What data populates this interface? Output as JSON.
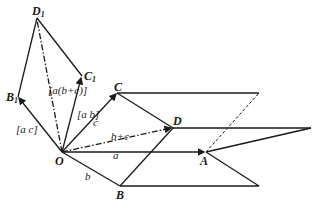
{
  "diagram": {
    "points": {
      "O": {
        "label": "O",
        "x": 62,
        "y": 152
      },
      "A": {
        "label": "A",
        "x": 206,
        "y": 152
      },
      "B": {
        "label": "B",
        "x": 120,
        "y": 186
      },
      "C": {
        "label": "C",
        "x": 117,
        "y": 93
      },
      "D": {
        "label": "D",
        "x": 173,
        "y": 128
      },
      "B1": {
        "label": "B",
        "sub": "1",
        "x": 18,
        "y": 97
      },
      "C1": {
        "label": "C",
        "sub": "1",
        "x": 82,
        "y": 76
      },
      "D1": {
        "label": "D",
        "sub": "1",
        "x": 37,
        "y": 18
      }
    },
    "vector_labels": {
      "a": "a",
      "b": "b",
      "c": "c",
      "b_plus_c": "b+c",
      "ab": "[a b]",
      "ac": "[a c]",
      "a_b_plus_c": "[a(b+c)]"
    },
    "colors": {
      "ink": "#1a1a1a",
      "background": "#ffffff"
    }
  }
}
